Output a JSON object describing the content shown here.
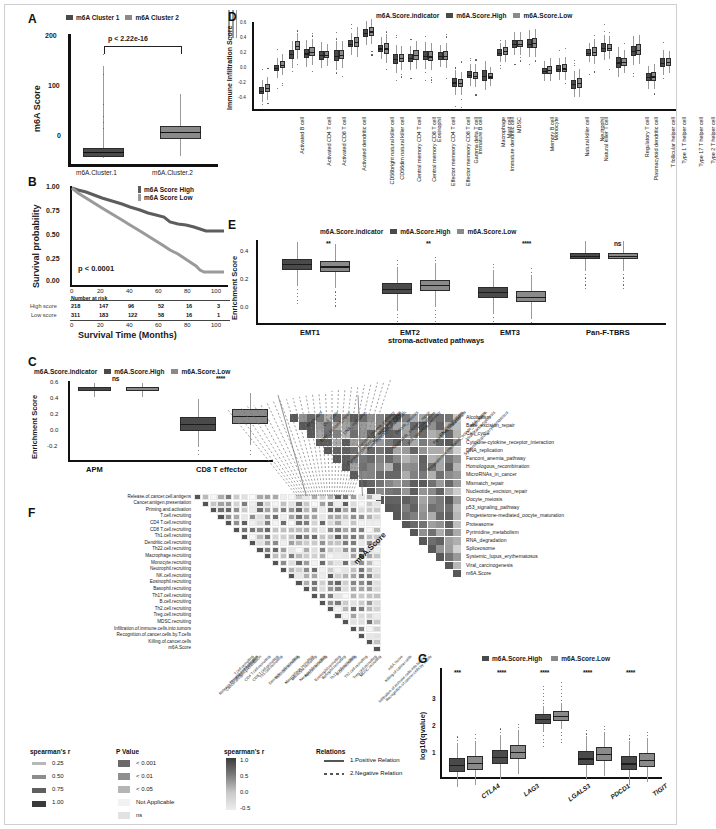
{
  "figure": {
    "panels": [
      "A",
      "B",
      "C",
      "D",
      "E",
      "F",
      "G"
    ]
  },
  "panelA": {
    "label": "A",
    "legend": [
      "m6A Cluster 1",
      "m6A Cluster 2"
    ],
    "pvalue": "p < 2.22e-16",
    "ylabel": "m6A Score",
    "yticks": [
      "200",
      "100",
      "0"
    ],
    "categories": [
      "m6A.Cluster.1",
      "m6A.Cluster.2"
    ]
  },
  "panelB": {
    "label": "B",
    "ylabel": "Survival probability",
    "xlabel": "Survival Time (Months)",
    "yticks": [
      "1.00",
      "0.75",
      "0.50",
      "0.25",
      "0.00"
    ],
    "xticks": [
      "0",
      "20",
      "40",
      "60",
      "80",
      "100"
    ],
    "pvalue": "p < 0.0001",
    "legend": [
      "m6A Score High",
      "m6A Score Low"
    ],
    "risk_title": "Number at risk",
    "risk_rows": [
      {
        "name": "High score",
        "values": [
          "218",
          "147",
          "96",
          "52",
          "16",
          "3"
        ]
      },
      {
        "name": "Low score",
        "values": [
          "311",
          "183",
          "122",
          "58",
          "16",
          "1"
        ]
      }
    ]
  },
  "panelC": {
    "label": "C",
    "legend_title": "m6A.Score.indicator",
    "legend": [
      "m6A.Score.High",
      "m6A.Score.Low"
    ],
    "ylabel": "Enrichment Score",
    "yticks": [
      "0.6",
      "0.4",
      "0.2",
      "0.0",
      "-0.2"
    ],
    "categories": [
      "APM",
      "CD8 T effector"
    ],
    "significance": [
      "ns",
      "****"
    ]
  },
  "panelD": {
    "label": "D",
    "legend_title": "m6A.Score.indicator",
    "legend": [
      "m6A.Score.High",
      "m6A.Score.Low"
    ],
    "ylabel": "Immune Infiltration Score",
    "yticks": [
      "0.6",
      "0.4",
      "0.2",
      "0.0",
      "-0.2",
      "-0.4"
    ],
    "categories": [
      "Activated B cell",
      "Activated CD4 T cell",
      "Activated CD8 T cell",
      "Activated dendritic cell",
      "CD56bright natural killer cell",
      "CD56dim natural killer cell",
      "Central memory CD4 T cell",
      "Central memory CD8 T cell",
      "Effector memeory CD4 T cell",
      "Effector memeory CD8 T cell",
      "Eosinophil",
      "Gamma delta T cell",
      "Immature  B cell",
      "Immature dendritic cell",
      "Macrophage",
      "Mast cell",
      "MDSC",
      "Memory B cell",
      "Monocyte",
      "Natural killer cell",
      "Natural killer T cell",
      "Neutrophil",
      "Plasmacytoid dendritic cell",
      "Regulatory T cell",
      "T follicular helper cell",
      "Type 1 T helper cell",
      "Type 17 T helper cell",
      "Type 2 T helper cell"
    ],
    "high_medians": [
      -0.21,
      0.06,
      0.22,
      0.23,
      0.21,
      0.205,
      0.345,
      0.47,
      0.29,
      0.165,
      0.175,
      0.205,
      0.2,
      -0.11,
      -0.02,
      -0.03,
      0.24,
      0.345,
      0.345,
      0.025,
      0.05,
      -0.13,
      0.24,
      0.3,
      0.125,
      0.26,
      -0.05,
      0.12
    ],
    "low_medians": [
      -0.18,
      0.1,
      0.32,
      0.25,
      0.215,
      0.215,
      0.365,
      0.49,
      0.29,
      0.175,
      0.21,
      0.195,
      0.205,
      -0.12,
      -0.03,
      -0.04,
      0.26,
      0.345,
      0.35,
      0.04,
      0.055,
      -0.12,
      0.25,
      0.3,
      0.135,
      0.275,
      -0.04,
      0.13
    ]
  },
  "panelE": {
    "label": "E",
    "legend_title": "m6A.Score.indicator",
    "legend": [
      "m6A.Score.High",
      "m6A.Score.Low"
    ],
    "ylabel": "Enrichment Score",
    "xlabel": "stroma-activated pathways",
    "yticks": [
      "0.4",
      "0.2",
      "0.0"
    ],
    "categories": [
      "EMT1",
      "EMT2",
      "EMT3",
      "Pan-F-TBRS"
    ],
    "significance": [
      "**",
      "**",
      "****",
      "ns"
    ],
    "high_medians": [
      0.305,
      0.13,
      0.105,
      0.365
    ],
    "low_medians": [
      0.29,
      0.155,
      0.075,
      0.365
    ]
  },
  "panelF": {
    "label": "F",
    "rows": [
      "Release.of.cancer.cell.antigens",
      "Cancer.antigen.presentation",
      "Priming.and.activation",
      "T.cell.recruiting",
      "CD4 T.cell.recruiting",
      "CD8 T.cell.recruiting",
      "Th1.cell.recruiting",
      "Dendritic.cell.recruiting",
      "Th22.cell.recruiting",
      "Macrophage.recruiting",
      "Monocyte.recruiting",
      "Neutrophil.recruiting",
      "NK.cell.recruiting",
      "Eosinophil.recruiting",
      "Basophil.recruiting",
      "Th17.cell.recruiting",
      "B.cell.recruiting",
      "Th2.cell.recruiting",
      "Treg.cell.recruiting",
      "MDSC.recruiting",
      "Infiltration.of.immune.cells.into.tumors",
      "Recognition.of.cancer.cells.by.T.cells",
      "Killing.of.cancer.cells",
      "m6A.Score"
    ]
  },
  "panelH": {
    "label": "heatmap-pathways",
    "rows": [
      "Alcoholism",
      "Base_excision_repair",
      "Cell_cycle",
      "Cytokine-cytokine_receptor_interaction",
      "DNA_replication",
      "Fanconi_anemia_pathway",
      "Homologous_recombination",
      "MicroRNAs_in_cancer",
      "Mismatch_repair",
      "Nucleotide_excision_repair",
      "Oocyte_meiosis",
      "p53_signaling_pathway",
      "Progesterone-mediated_oocyte_maturation",
      "Proteasome",
      "Pyrimidine_metabolism",
      "RNA_degradation",
      "Spliceosome",
      "Systemic_lupus_erythematosus",
      "Viral_carcinogenesis",
      "m6A.Score"
    ],
    "corner_label": "m6A.Score"
  },
  "panelG": {
    "label": "G",
    "legend": [
      "m6A.Score.High",
      "m6A.Score.Low"
    ],
    "ylabel": "log10(qvalue)",
    "yticks": [
      "3",
      "2",
      "1"
    ],
    "categories": [
      "CTLA4",
      "LAG3",
      "LGALS3",
      "PDCD1",
      "TIGIT"
    ],
    "significance": [
      "***",
      "****",
      "****",
      "****",
      "****"
    ],
    "high_medians": [
      0.52,
      0.82,
      2.22,
      0.76,
      0.58
    ],
    "low_medians": [
      0.6,
      1.0,
      2.35,
      0.92,
      0.7
    ]
  },
  "legends": {
    "spearman_r_title": "spearman's r",
    "spearman_r_items": [
      "0.25",
      "0.50",
      "0.75",
      "1.00"
    ],
    "pvalue_title": "P Value",
    "pvalue_items": [
      "< 0.001",
      "< 0.01",
      "< 0.05",
      "Not Applicable",
      "ns"
    ],
    "scale_title": "spearman's r",
    "scale_ticks": [
      "1.0",
      "0.5",
      "0.0",
      "-0.5"
    ],
    "relations_title": "Relations",
    "relations_items": [
      "1.Positive Relation",
      "2.Negative Relation"
    ]
  },
  "colors": {
    "high": "#4a4a4a",
    "low": "#8a8a8a",
    "km_high": "#5a5a5a",
    "km_low": "#909090",
    "axis": "#111111",
    "heat_high": "#4f4f4f",
    "heat_low": "#f0f0f0"
  }
}
